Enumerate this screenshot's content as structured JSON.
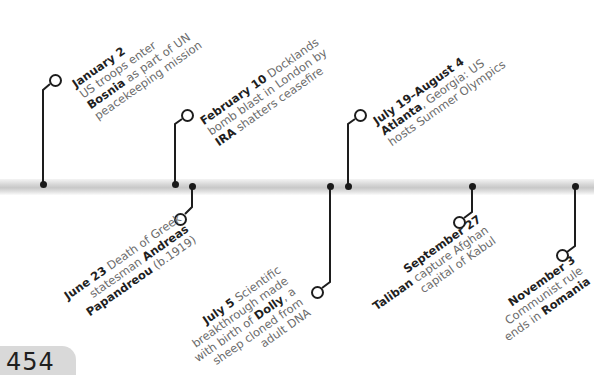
{
  "timeline": {
    "events": [
      {
        "date": "January 2",
        "lines": [
          [
            "US troops enter"
          ],
          [
            "Bosnia",
            " as part of UN"
          ],
          [
            "peacekeeping mission"
          ]
        ],
        "side": "above"
      },
      {
        "date": "February 10",
        "lines": [
          [
            " Docklands"
          ],
          [
            "bomb blast in London by"
          ],
          [
            "IRA",
            " shatters ceasefire"
          ]
        ],
        "side": "above"
      },
      {
        "date": "June 23",
        "lines": [
          [
            " Death of Greek"
          ],
          [
            "statesman ",
            "Andreas"
          ],
          [
            "Papandreou",
            " (b.1919)"
          ]
        ],
        "side": "below"
      },
      {
        "date": "July 5",
        "lines": [
          [
            " Scientific"
          ],
          [
            "breakthrough made"
          ],
          [
            "with birth of ",
            "Dolly",
            ", a"
          ],
          [
            "sheep cloned from"
          ],
          [
            "adult DNA"
          ]
        ],
        "side": "below"
      },
      {
        "date": "July 19–August 4",
        "lines": [
          [
            "Atlanta",
            ", Georgia: US"
          ],
          [
            "hosts Summer Olympics"
          ]
        ],
        "side": "above"
      },
      {
        "date": "September 27",
        "lines": [
          [
            "Taliban",
            " capture Afghan"
          ],
          [
            "capital of Kabul"
          ]
        ],
        "side": "below"
      },
      {
        "date": "November 3",
        "lines": [
          [
            "Communist rule"
          ],
          [
            "ends in ",
            "Romania"
          ]
        ],
        "side": "below"
      }
    ],
    "text": {
      "jan_date": "January 2",
      "jan_l1": "US troops enter",
      "jan_l2b": "Bosnia",
      "jan_l2": " as part of UN",
      "jan_l3": "peacekeeping mission",
      "feb_date": "February 10",
      "feb_l1": " Docklands",
      "feb_l2": "bomb blast in London by",
      "feb_l3b": "IRA",
      "feb_l3": " shatters ceasefire",
      "jun_date": "June 23",
      "jun_l1": " Death of Greek",
      "jun_l2": "statesman ",
      "jun_l2b": "Andreas",
      "jun_l3b": "Papandreou",
      "jun_l3": " (b.1919)",
      "jul_date": "July 5",
      "jul_l1": " Scientific",
      "jul_l2": "breakthrough made",
      "jul_l3a": "with birth of ",
      "jul_l3b": "Dolly",
      "jul_l3c": ", a",
      "jul_l4": "sheep cloned from",
      "jul_l5": "adult DNA",
      "oly_date": "July 19–August 4",
      "oly_l1b": "Atlanta",
      "oly_l1": ", Georgia: US",
      "oly_l2": "hosts Summer Olympics",
      "sep_date": "September 27",
      "sep_l1b": "Taliban",
      "sep_l1": " capture Afghan",
      "sep_l2": "capital of Kabul",
      "nov_date": "November 3",
      "nov_l1": "Communist rule",
      "nov_l2": "ends in ",
      "nov_l2b": "Romania"
    }
  },
  "page_number": "454",
  "colors": {
    "line": "#1d1d1d",
    "bar": "#cccccc",
    "date_text": "#1f1f1f",
    "body_text": "#6b6b6b",
    "page_tab": "#d9d9d9"
  }
}
